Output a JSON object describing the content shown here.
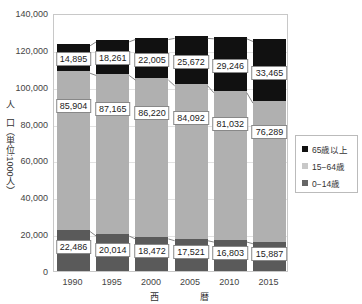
{
  "chart_data": {
    "type": "bar",
    "stacked": true,
    "title": "",
    "xlabel": "西　暦",
    "ylabel": "人　口（単位:1000人）",
    "ylim": [
      0,
      140000
    ],
    "yticks": [
      "0",
      "20,000",
      "40,000",
      "60,000",
      "80,000",
      "100,000",
      "120,000",
      "140,000"
    ],
    "categories": [
      "1990",
      "1995",
      "2000",
      "2005",
      "2010",
      "2015"
    ],
    "grid": true,
    "legend_position": "right",
    "series": [
      {
        "name": "0–14歳",
        "color": "#5a5a5a",
        "values": [
          22486,
          20014,
          18472,
          17521,
          16803,
          15887
        ],
        "labels": [
          "22,486",
          "20,014",
          "18,472",
          "17,521",
          "16,803",
          "15,887"
        ]
      },
      {
        "name": "15–64歳",
        "color": "#b0b0b0",
        "values": [
          85904,
          87165,
          86220,
          84092,
          81032,
          76289
        ],
        "labels": [
          "85,904",
          "87,165",
          "86,220",
          "84,092",
          "81,032",
          "76,289"
        ]
      },
      {
        "name": "65歳以上",
        "color": "#111111",
        "values": [
          14895,
          18261,
          22005,
          25672,
          29246,
          33465
        ],
        "labels": [
          "14,895",
          "18,261",
          "22,005",
          "25,672",
          "29,246",
          "33,465"
        ]
      }
    ],
    "legend": [
      "65歳以上",
      "15−64歳",
      "0−14歳"
    ]
  }
}
